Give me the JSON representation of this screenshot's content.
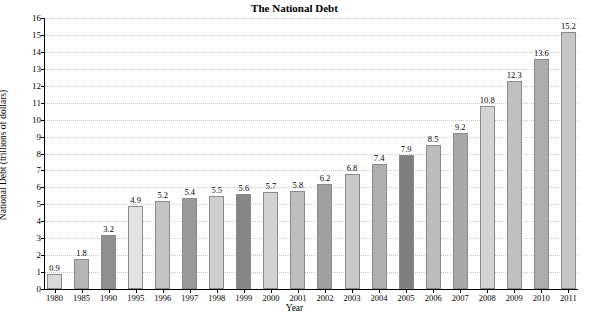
{
  "chart_data": {
    "type": "bar",
    "title": "The National Debt",
    "xlabel": "Year",
    "ylabel": "National Debt (trillions of dollars)",
    "ylim": [
      0,
      16
    ],
    "ytick_step": 1,
    "grid": true,
    "legend": "none",
    "categories": [
      "1980",
      "1985",
      "1990",
      "1995",
      "1996",
      "1997",
      "1998",
      "1999",
      "2000",
      "2001",
      "2002",
      "2003",
      "2004",
      "2005",
      "2006",
      "2007",
      "2008",
      "2009",
      "2010",
      "2011"
    ],
    "values": [
      0.9,
      1.8,
      3.2,
      4.9,
      5.2,
      5.4,
      5.5,
      5.6,
      5.7,
      5.8,
      6.2,
      6.8,
      7.4,
      7.9,
      8.5,
      9.2,
      10.8,
      12.3,
      13.6,
      15.2
    ],
    "value_labels": [
      "0.9",
      "1.8",
      "3.2",
      "4.9",
      "5.2",
      "5.4",
      "5.5",
      "5.6",
      "5.7",
      "5.8",
      "6.2",
      "6.8",
      "7.4",
      "7.9",
      "8.5",
      "9.2",
      "10.8",
      "12.3",
      "13.6",
      "15.2"
    ],
    "ytick_labels": [
      "0",
      "1",
      "2",
      "3",
      "4",
      "5",
      "6",
      "7",
      "8",
      "9",
      "10",
      "11",
      "12",
      "13",
      "14",
      "15",
      "16"
    ],
    "bar_colors": [
      "#d9d9d9",
      "#b5b5b5",
      "#8f8f8f",
      "#e3e3e3",
      "#c4c4c4",
      "#9a9a9a",
      "#cfcfcf",
      "#868686",
      "#d2d2d2",
      "#bdbdbd",
      "#9f9f9f",
      "#c9c9c9",
      "#b0b0b0",
      "#7f7f7f",
      "#bcbcbc",
      "#a8a8a8",
      "#d4d4d4",
      "#bfbfbf",
      "#adadad",
      "#c6c6c6"
    ]
  }
}
